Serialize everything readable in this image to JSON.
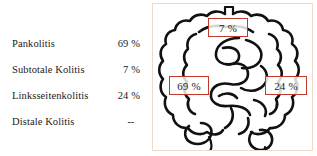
{
  "legend": {
    "rows": [
      {
        "label": "Pankolitis",
        "value": "69 %"
      },
      {
        "label": "Subtotale Kolitis",
        "value": "7 %"
      },
      {
        "label": "Linksseitenkolitis",
        "value": "24 %"
      },
      {
        "label": "Distale Kolitis",
        "value": "--"
      }
    ]
  },
  "diagram": {
    "callouts": [
      {
        "name": "transverse-colon",
        "value": "7 %"
      },
      {
        "name": "ascending-colon",
        "value": "69 %"
      },
      {
        "name": "descending-colon",
        "value": "24 %"
      }
    ]
  },
  "colors": {
    "callout_border": "#c0392b",
    "panel_border": "#efd9c8",
    "drawing_stroke": "#111111",
    "background": "#ffffff",
    "text": "#1a1a1a"
  }
}
